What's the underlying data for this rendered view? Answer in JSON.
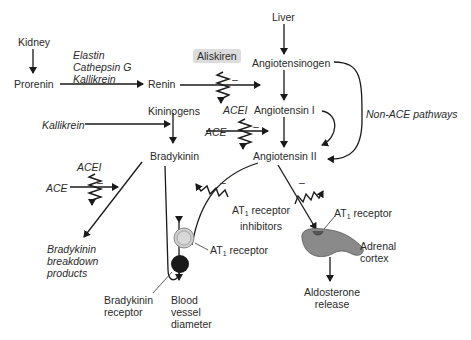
{
  "nodes": {
    "kidney": "Kidney",
    "prorenin": "Prorenin",
    "enzymes": [
      "Elastin",
      "Cathepsin G",
      "Kallikrein"
    ],
    "renin": "Renin",
    "aliskiren": "Aliskiren",
    "liver": "Liver",
    "angiotensinogen": "Angiotensinogen",
    "angiotensin1": "Angiotensin I",
    "angiotensin2": "Angiotensin II",
    "non_ace": "Non-ACE pathways",
    "kininogens": "Kininogens",
    "kallikrein": "Kallikrein",
    "bradykinin": "Bradykinin",
    "acei_top": "ACEI",
    "ace_top": "ACE",
    "acei_left": "ACEI",
    "ace_left": "ACE",
    "bk_breakdown": [
      "Bradykinin",
      "breakdown",
      "products"
    ],
    "at1_inhib": [
      "AT",
      "1",
      " receptor",
      "inhibitors"
    ],
    "at1_receptor_left": [
      "AT",
      "1",
      " receptor"
    ],
    "at1_receptor_right": [
      "AT",
      "1",
      " receptor"
    ],
    "adrenal": [
      "Adrenal",
      "cortex"
    ],
    "aldosterone": [
      "Aldosterone",
      "release"
    ],
    "bk_receptor": [
      "Bradykinin",
      "receptor"
    ],
    "blood_vessel": [
      "Blood",
      "vessel",
      "diameter"
    ],
    "minus": "–"
  },
  "colors": {
    "line": "#1a1a1a",
    "aliskiren_box": "#dcdcdc",
    "adrenal": "#8a8a8a",
    "at1_circle": "#cfcfcf",
    "bk_circle": "#1a1a1a"
  }
}
